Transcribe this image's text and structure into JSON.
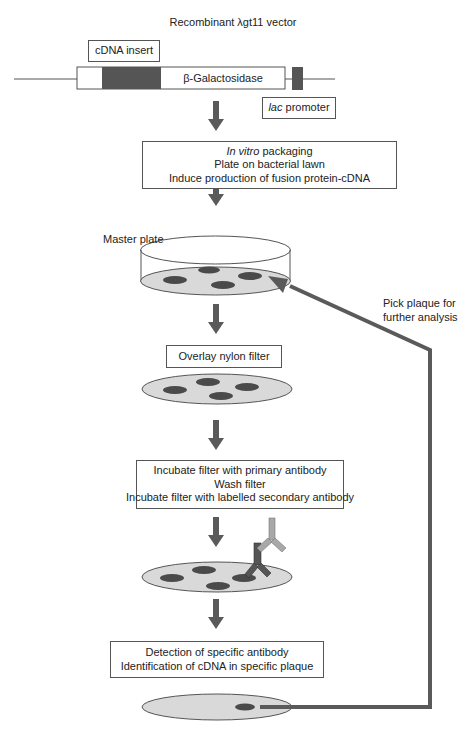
{
  "title": "Recombinant λgt11 vector",
  "vector": {
    "insert_label": "cDNA insert",
    "gene_label": "β-Galactosidase",
    "promoter_label_italic": "lac",
    "promoter_label_rest": " promoter"
  },
  "steps": {
    "packaging": {
      "line1_italic": "In vitro",
      "line1_rest": " packaging",
      "line2": "Plate on bacterial lawn",
      "line3": "Induce production of fusion protein-cDNA"
    },
    "master_plate_label": "Master plate",
    "overlay": "Overlay nylon filter",
    "incubate": {
      "line1": "Incubate filter with primary antibody",
      "line2": "Wash filter",
      "line3": "Incubate filter with labelled secondary antibody"
    },
    "detection": {
      "line1": "Detection of specific antibody",
      "line2": "Identification of cDNA in specific plaque"
    }
  },
  "feedback_label": {
    "line1": "Pick plaque for",
    "line2": "further analysis"
  },
  "colors": {
    "arrow": "#5a5a5a",
    "dark_segment": "#555555",
    "plate_fill": "#d9d9d9",
    "plaque": "#4a4a4a",
    "primary_antibody": "#555555",
    "secondary_antibody": "#a8a8a8",
    "outline": "#555555"
  }
}
